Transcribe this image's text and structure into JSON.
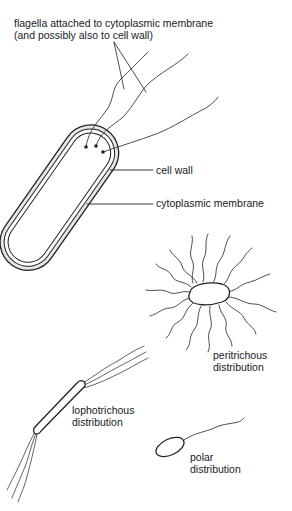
{
  "labels": {
    "flagella_line1": "flagella attached to cytoplasmic membrane",
    "flagella_line2": "(and possibly also to cell wall)",
    "cell_wall": "cell wall",
    "cytoplasmic_membrane": "cytoplasmic membrane",
    "peritrichous_line1": "peritrichous",
    "peritrichous_line2": "distribution",
    "lophotrichous_line1": "lophotrichous",
    "lophotrichous_line2": "distribution",
    "polar_line1": "polar",
    "polar_line2": "distribution"
  }
}
